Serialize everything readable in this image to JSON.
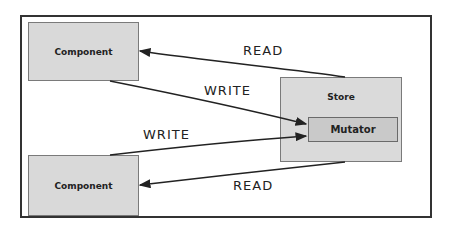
{
  "diagram": {
    "nodes": {
      "component_top": {
        "label": "Component"
      },
      "component_bottom": {
        "label": "Component"
      },
      "store": {
        "label": "Store"
      },
      "mutator": {
        "label": "Mutator"
      }
    },
    "edges": [
      {
        "from": "store",
        "to": "component_top",
        "label": "READ"
      },
      {
        "from": "component_top",
        "to": "mutator",
        "label": "WRITE"
      },
      {
        "from": "component_bottom",
        "to": "mutator",
        "label": "WRITE"
      },
      {
        "from": "store",
        "to": "component_bottom",
        "label": "READ"
      }
    ]
  },
  "colors": {
    "box_fill": "#d9d9d9",
    "mutator_fill": "#c9c9c9",
    "line": "#222222",
    "frame": "#333333"
  }
}
